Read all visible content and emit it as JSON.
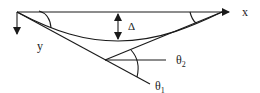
{
  "diagram": {
    "labels": {
      "x_axis": "x",
      "y_axis": "y",
      "deflection": "Δ",
      "theta2": "θ",
      "theta2_sub": "2",
      "theta1": "θ",
      "theta1_sub": "1"
    },
    "colors": {
      "stroke": "#1a1a1a",
      "text": "#222222",
      "background": "#ffffff"
    }
  }
}
